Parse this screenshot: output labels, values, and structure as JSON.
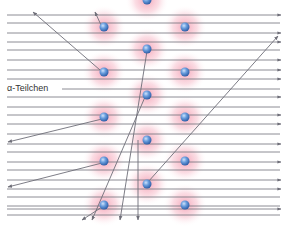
{
  "diagram": {
    "label": "α-Teilchen",
    "colors": {
      "line": "#6e6e78",
      "atom_core": "#5b8fd6",
      "atom_halo": "#f4a6b8",
      "label_text": "#333333"
    },
    "atoms": [
      {
        "x": 147,
        "y": 0
      },
      {
        "x": 104,
        "y": 27
      },
      {
        "x": 185,
        "y": 27
      },
      {
        "x": 147,
        "y": 49
      },
      {
        "x": 104,
        "y": 72
      },
      {
        "x": 185,
        "y": 72
      },
      {
        "x": 147,
        "y": 95
      },
      {
        "x": 104,
        "y": 117
      },
      {
        "x": 185,
        "y": 117
      },
      {
        "x": 147,
        "y": 140
      },
      {
        "x": 104,
        "y": 161
      },
      {
        "x": 185,
        "y": 161
      },
      {
        "x": 147,
        "y": 184
      },
      {
        "x": 104,
        "y": 205
      },
      {
        "x": 185,
        "y": 205
      }
    ],
    "straight_rays_y": [
      15,
      33,
      42,
      60,
      70,
      79,
      97,
      115,
      124,
      144,
      162,
      180,
      189,
      209
    ],
    "background_lines_y": [
      14,
      23,
      32,
      41,
      50,
      59,
      69,
      89,
      98,
      107,
      116,
      125,
      134,
      143,
      152,
      161,
      170,
      179,
      188,
      197,
      206,
      215
    ],
    "deflected_rays": [
      {
        "from": [
          101,
          25
        ],
        "to": [
          95,
          12
        ]
      },
      {
        "from": [
          100,
          70
        ],
        "to": [
          33,
          12
        ]
      },
      {
        "from": [
          102,
          119
        ],
        "to": [
          8,
          142
        ]
      },
      {
        "from": [
          102,
          163
        ],
        "to": [
          8,
          187
        ]
      },
      {
        "from": [
          147,
          51
        ],
        "to": [
          120,
          220
        ]
      },
      {
        "from": [
          145,
          97
        ],
        "to": [
          92,
          220
        ]
      },
      {
        "from": [
          148,
          182
        ],
        "to": [
          278,
          36
        ]
      },
      {
        "from": [
          138,
          140
        ],
        "to": [
          138,
          220
        ]
      },
      {
        "from": [
          102,
          207
        ],
        "to": [
          82,
          220
        ]
      }
    ]
  }
}
